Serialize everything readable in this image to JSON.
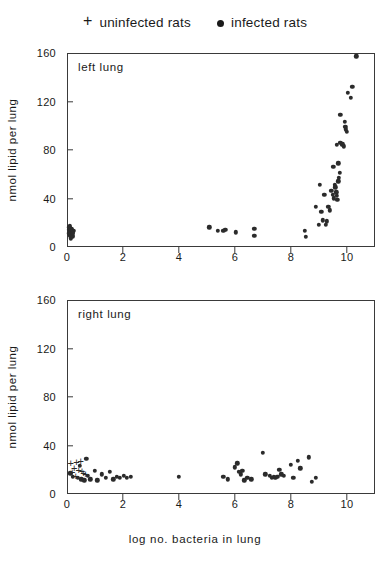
{
  "legend": {
    "uninfected": {
      "marker": "plus-marker",
      "label": "uninfected rats"
    },
    "infected": {
      "marker": "dot-marker",
      "label": "infected rats"
    }
  },
  "axis_titles": {
    "y": "nmol lipid per lung",
    "x": "log no. bacteria in lung"
  },
  "chart_data": [
    {
      "type": "scatter",
      "title": "left lung",
      "xlabel": "log no. bacteria in lung",
      "ylabel": "nmol lipid per lung",
      "xlim": [
        0,
        11
      ],
      "ylim": [
        0,
        160
      ],
      "xticks": [
        0,
        2,
        4,
        6,
        8,
        10
      ],
      "yticks": [
        0,
        40,
        80,
        120,
        160
      ],
      "grid": false,
      "legend_position": "above-figure",
      "series": [
        {
          "name": "uninfected rats",
          "marker": "+",
          "points": []
        },
        {
          "name": "infected rats",
          "marker": "o",
          "points": [
            [
              0.05,
              15
            ],
            [
              0.07,
              13
            ],
            [
              0.1,
              12
            ],
            [
              0.12,
              16
            ],
            [
              0.06,
              10
            ],
            [
              0.14,
              11
            ],
            [
              0.09,
              14
            ],
            [
              0.16,
              9
            ],
            [
              0.04,
              17
            ],
            [
              0.11,
              8
            ],
            [
              0.18,
              13
            ],
            [
              0.08,
              11
            ],
            [
              0.13,
              15
            ],
            [
              0.03,
              12
            ],
            [
              0.15,
              10
            ],
            [
              0.2,
              14
            ],
            [
              0.06,
              18
            ],
            [
              0.17,
              12
            ],
            [
              5.05,
              17
            ],
            [
              5.35,
              14
            ],
            [
              5.55,
              14
            ],
            [
              5.62,
              15
            ],
            [
              6.0,
              13
            ],
            [
              6.65,
              16
            ],
            [
              6.66,
              10
            ],
            [
              8.45,
              14
            ],
            [
              8.5,
              9
            ],
            [
              9.1,
              23
            ],
            [
              9.25,
              22
            ],
            [
              9.3,
              34
            ],
            [
              9.35,
              31
            ],
            [
              9.4,
              47
            ],
            [
              9.45,
              44
            ],
            [
              9.5,
              41
            ],
            [
              9.52,
              52
            ],
            [
              9.55,
              50
            ],
            [
              9.58,
              46
            ],
            [
              9.6,
              43
            ],
            [
              9.62,
              40
            ],
            [
              9.65,
              55
            ],
            [
              9.68,
              58
            ],
            [
              9.7,
              62
            ],
            [
              9.72,
              87
            ],
            [
              9.78,
              85
            ],
            [
              9.82,
              86
            ],
            [
              9.85,
              84
            ],
            [
              9.88,
              104
            ],
            [
              9.9,
              100
            ],
            [
              9.93,
              98
            ],
            [
              9.6,
              85
            ],
            [
              9.72,
              110
            ],
            [
              9.95,
              96
            ],
            [
              10.0,
              128
            ],
            [
              10.1,
              124
            ],
            [
              10.15,
              133
            ],
            [
              10.3,
              158
            ],
            [
              9.05,
              30
            ],
            [
              9.15,
              44
            ],
            [
              9.2,
              19
            ],
            [
              8.95,
              19
            ],
            [
              8.85,
              34
            ],
            [
              9.0,
              52
            ],
            [
              9.48,
              67
            ],
            [
              9.66,
              70
            ]
          ]
        }
      ]
    },
    {
      "type": "scatter",
      "title": "right lung",
      "xlabel": "log no. bacteria in lung",
      "ylabel": "nmol lipid per lung",
      "xlim": [
        0,
        11
      ],
      "ylim": [
        0,
        160
      ],
      "xticks": [
        0,
        2,
        4,
        6,
        8,
        10
      ],
      "yticks": [
        0,
        40,
        80,
        120,
        160
      ],
      "grid": false,
      "legend_position": "above-figure",
      "series": [
        {
          "name": "uninfected rats",
          "marker": "+",
          "points": [
            [
              0.1,
              26
            ],
            [
              0.3,
              27
            ],
            [
              0.45,
              28
            ],
            [
              0.22,
              22
            ],
            [
              0.38,
              21
            ],
            [
              0.5,
              20
            ],
            [
              0.15,
              19
            ],
            [
              0.55,
              18
            ],
            [
              0.62,
              17
            ],
            [
              0.28,
              16
            ]
          ]
        },
        {
          "name": "infected rats",
          "marker": "o",
          "points": [
            [
              0.08,
              18
            ],
            [
              0.18,
              15
            ],
            [
              0.35,
              14
            ],
            [
              0.48,
              13
            ],
            [
              0.58,
              12
            ],
            [
              0.7,
              16
            ],
            [
              0.8,
              13
            ],
            [
              0.95,
              20
            ],
            [
              1.05,
              12
            ],
            [
              1.2,
              17
            ],
            [
              1.35,
              14
            ],
            [
              1.5,
              19
            ],
            [
              1.62,
              13
            ],
            [
              1.75,
              15
            ],
            [
              1.85,
              14
            ],
            [
              2.0,
              16
            ],
            [
              2.1,
              14
            ],
            [
              2.25,
              15
            ],
            [
              0.65,
              30
            ],
            [
              0.42,
              24
            ],
            [
              3.95,
              15
            ],
            [
              5.55,
              15
            ],
            [
              5.7,
              13
            ],
            [
              5.95,
              23
            ],
            [
              6.05,
              26
            ],
            [
              6.1,
              19
            ],
            [
              6.18,
              17
            ],
            [
              6.22,
              20
            ],
            [
              6.3,
              12
            ],
            [
              6.55,
              13
            ],
            [
              6.95,
              35
            ],
            [
              7.05,
              17
            ],
            [
              7.2,
              16
            ],
            [
              7.35,
              15
            ],
            [
              7.4,
              14
            ],
            [
              7.55,
              21
            ],
            [
              7.62,
              17
            ],
            [
              7.7,
              16
            ],
            [
              7.95,
              25
            ],
            [
              8.05,
              14
            ],
            [
              8.2,
              28
            ],
            [
              8.3,
              22
            ],
            [
              8.6,
              31
            ],
            [
              8.7,
              11
            ],
            [
              8.85,
              14
            ],
            [
              6.4,
              14
            ],
            [
              7.28,
              14
            ],
            [
              7.48,
              15
            ]
          ]
        }
      ]
    }
  ]
}
